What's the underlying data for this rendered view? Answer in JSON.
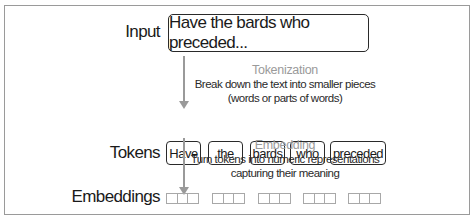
{
  "diagram": {
    "rows": {
      "input": {
        "label": "Input",
        "text": "Have the bards who preceded..."
      },
      "tokens": {
        "label": "Tokens",
        "items": [
          "Have",
          "the",
          "bards",
          "who",
          "preceded"
        ]
      },
      "embeddings": {
        "label": "Embeddings",
        "count": 5,
        "cells_per_vector": 3
      }
    },
    "steps": {
      "tokenization": {
        "title": "Tokenization",
        "line1": "Break down the text into smaller pieces",
        "line2": "(words or parts of words)"
      },
      "embedding": {
        "title": "Embedding",
        "line1": "Turn tokens into numeric representations",
        "line2": "capturing their meaning"
      }
    },
    "colors": {
      "accent_gray": "#9a9a9a",
      "text": "#1a1a1a",
      "border": "#2a2a2a"
    }
  }
}
